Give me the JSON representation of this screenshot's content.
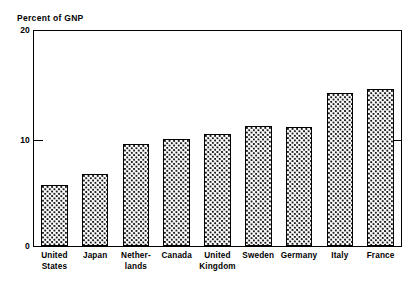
{
  "chart_data": {
    "type": "bar",
    "title": "",
    "subtitle": "",
    "ylabel": "Percent of GNP",
    "xlabel": "",
    "ylim": [
      0,
      20
    ],
    "yticks": [
      0,
      10,
      20
    ],
    "ytick_labels": [
      "0",
      "10",
      "20"
    ],
    "grid": false,
    "legend": false,
    "categories": [
      "United\nStates",
      "Japan",
      "Nether-\nlands",
      "Canada",
      "United\nKingdom",
      "Sweden",
      "Germany",
      "Italy",
      "France"
    ],
    "category_labels_plain": [
      "United States",
      "Japan",
      "Netherlands",
      "Canada",
      "United Kingdom",
      "Sweden",
      "Germany",
      "Italy",
      "France"
    ],
    "values": [
      5.7,
      6.7,
      9.5,
      10.0,
      10.4,
      11.2,
      11.1,
      14.2,
      14.6
    ],
    "bar_fill": "dotted-stipple",
    "bar_edge_color": "#000000",
    "bar_fill_color": "#ffffff",
    "bar_dot_color": "#1a1a1a",
    "frame_color": "#000000",
    "background_color": "#ffffff"
  },
  "axis": {
    "y_title": "Percent of GNP",
    "tick_top": "20",
    "tick_mid": "10",
    "tick_bottom": "0"
  }
}
